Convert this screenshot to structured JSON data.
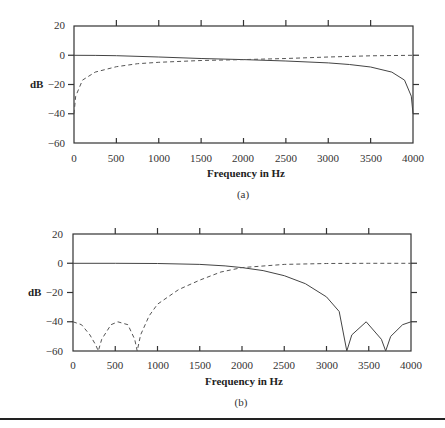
{
  "chart_data": [
    {
      "type": "line",
      "panel_label": "(a)",
      "title": "",
      "xlabel": "Frequency in Hz",
      "ylabel": "dB",
      "xlim": [
        0,
        4000
      ],
      "ylim": [
        -60,
        20
      ],
      "x_ticks": [
        0,
        500,
        1000,
        1500,
        2000,
        2500,
        3000,
        3500,
        4000
      ],
      "y_ticks": [
        20,
        0,
        -20,
        -40,
        -60
      ],
      "grid": false,
      "legend": null,
      "series": [
        {
          "name": "solid (lowpass)",
          "style": "solid",
          "x": [
            0,
            250,
            500,
            1000,
            1500,
            2000,
            2500,
            3000,
            3250,
            3500,
            3750,
            3900,
            3980,
            4000
          ],
          "y": [
            0,
            -0.1,
            -0.3,
            -1.2,
            -2.2,
            -3.0,
            -3.9,
            -5.2,
            -6.3,
            -8.0,
            -11.5,
            -17,
            -28,
            -40
          ]
        },
        {
          "name": "dashed (highpass)",
          "style": "dashed",
          "x": [
            0,
            20,
            100,
            250,
            500,
            750,
            1000,
            1500,
            2000,
            2500,
            3000,
            3500,
            4000
          ],
          "y": [
            -40,
            -28,
            -17,
            -11.5,
            -7.8,
            -5.8,
            -4.8,
            -3.6,
            -3.0,
            -2.2,
            -1.2,
            -0.4,
            0
          ]
        }
      ]
    },
    {
      "type": "line",
      "panel_label": "(b)",
      "title": "",
      "xlabel": "Frequency in Hz",
      "ylabel": "dB",
      "xlim": [
        0,
        4000
      ],
      "ylim": [
        -60,
        20
      ],
      "x_ticks": [
        0,
        500,
        1000,
        1500,
        2000,
        2500,
        3000,
        3500,
        4000
      ],
      "y_ticks": [
        20,
        0,
        -20,
        -40,
        -60
      ],
      "grid": false,
      "legend": null,
      "series": [
        {
          "name": "solid (lowpass)",
          "style": "solid",
          "x": [
            0,
            500,
            1000,
            1500,
            1800,
            2000,
            2250,
            2500,
            2750,
            3000,
            3150,
            3240,
            3300,
            3470,
            3650,
            3700,
            3760,
            3900,
            4000
          ],
          "y": [
            0,
            0,
            -0.2,
            -0.8,
            -1.8,
            -3.0,
            -5.0,
            -8.5,
            -14,
            -23,
            -33,
            -60,
            -49,
            -40,
            -52,
            -60,
            -50,
            -42,
            -40
          ]
        },
        {
          "name": "dashed (highpass)",
          "style": "dashed",
          "x": [
            0,
            100,
            200,
            270,
            300,
            340,
            450,
            530,
            650,
            730,
            760,
            800,
            900,
            1000,
            1250,
            1500,
            1750,
            2000,
            2500,
            3000,
            3500,
            4000
          ],
          "y": [
            -40,
            -42,
            -49,
            -56,
            -60,
            -52,
            -42,
            -40,
            -42,
            -52,
            -60,
            -49,
            -36,
            -28,
            -18,
            -11.5,
            -6,
            -3.0,
            -0.8,
            -0.2,
            0,
            0
          ]
        }
      ]
    }
  ],
  "panels": [
    {
      "y_tick_labels": [
        "20",
        "0",
        "−20",
        "−40",
        "−60"
      ],
      "x_tick_labels": [
        "0",
        "500",
        "1000",
        "1500",
        "2000",
        "2500",
        "3000",
        "3500",
        "4000"
      ],
      "ylabel": "dB",
      "xlabel": "Frequency in Hz",
      "caption": "(a)"
    },
    {
      "y_tick_labels": [
        "20",
        "0",
        "−20",
        "−40",
        "−60"
      ],
      "x_tick_labels": [
        "0",
        "500",
        "1000",
        "1500",
        "2000",
        "2500",
        "3000",
        "3500",
        "4000"
      ],
      "ylabel": "dB",
      "xlabel": "Frequency in Hz",
      "caption": "(b)"
    }
  ]
}
